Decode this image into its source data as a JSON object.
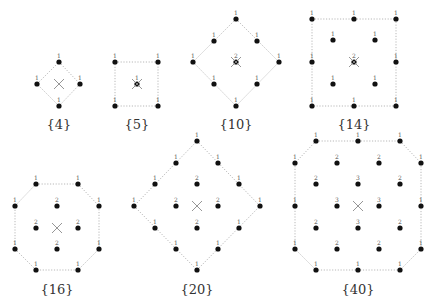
{
  "diagrams": [
    {
      "label": "{4}",
      "caption_pos": [
        59,
        129
      ],
      "center": [
        59,
        84
      ],
      "outline": [
        [
          59,
          62
        ],
        [
          80,
          84
        ],
        [
          59,
          106
        ],
        [
          37,
          84
        ]
      ],
      "points": [
        {
          "x": 59,
          "y": 62,
          "w": "1"
        },
        {
          "x": 37,
          "y": 84,
          "w": "1"
        },
        {
          "x": 80,
          "y": 84,
          "w": "1"
        },
        {
          "x": 59,
          "y": 106,
          "w": "1"
        }
      ]
    },
    {
      "label": "{5}",
      "caption_pos": [
        137,
        129
      ],
      "center": [
        137,
        84
      ],
      "outline": [
        [
          115,
          62
        ],
        [
          158,
          62
        ],
        [
          158,
          106
        ],
        [
          115,
          106
        ]
      ],
      "points": [
        {
          "x": 115,
          "y": 62,
          "w": "1"
        },
        {
          "x": 158,
          "y": 62,
          "w": "1"
        },
        {
          "x": 137,
          "y": 84,
          "w": "1"
        },
        {
          "x": 115,
          "y": 106,
          "w": "1"
        },
        {
          "x": 158,
          "y": 106,
          "w": "1"
        }
      ]
    },
    {
      "label": "{10}",
      "caption_pos": [
        236,
        129
      ],
      "center": [
        236,
        62
      ],
      "outline": [
        [
          236,
          19
        ],
        [
          279,
          62
        ],
        [
          236,
          106
        ],
        [
          193,
          62
        ]
      ],
      "points": [
        {
          "x": 236,
          "y": 19,
          "w": "1"
        },
        {
          "x": 214,
          "y": 41,
          "w": "1"
        },
        {
          "x": 257,
          "y": 41,
          "w": "1"
        },
        {
          "x": 193,
          "y": 62,
          "w": "1"
        },
        {
          "x": 236,
          "y": 62,
          "w": "2"
        },
        {
          "x": 279,
          "y": 62,
          "w": "1"
        },
        {
          "x": 214,
          "y": 84,
          "w": "1"
        },
        {
          "x": 257,
          "y": 84,
          "w": "1"
        },
        {
          "x": 236,
          "y": 106,
          "w": "1"
        }
      ]
    },
    {
      "label": "{14}",
      "caption_pos": [
        354,
        129
      ],
      "center": [
        354,
        62
      ],
      "outline": [
        [
          312,
          19
        ],
        [
          396,
          19
        ],
        [
          396,
          106
        ],
        [
          312,
          106
        ]
      ],
      "points": [
        {
          "x": 312,
          "y": 19,
          "w": "1"
        },
        {
          "x": 354,
          "y": 19,
          "w": "1"
        },
        {
          "x": 396,
          "y": 19,
          "w": "1"
        },
        {
          "x": 333,
          "y": 40,
          "w": "1"
        },
        {
          "x": 375,
          "y": 40,
          "w": "1"
        },
        {
          "x": 312,
          "y": 62,
          "w": "1"
        },
        {
          "x": 354,
          "y": 62,
          "w": "2"
        },
        {
          "x": 396,
          "y": 62,
          "w": "1"
        },
        {
          "x": 333,
          "y": 84,
          "w": "1"
        },
        {
          "x": 375,
          "y": 84,
          "w": "1"
        },
        {
          "x": 312,
          "y": 106,
          "w": "1"
        },
        {
          "x": 354,
          "y": 106,
          "w": "1"
        },
        {
          "x": 396,
          "y": 106,
          "w": "1"
        }
      ]
    },
    {
      "label": "{16}",
      "caption_pos": [
        57,
        294
      ],
      "center": [
        57,
        228
      ],
      "outline": [
        [
          36,
          184
        ],
        [
          78,
          184
        ],
        [
          99,
          206
        ],
        [
          99,
          249
        ],
        [
          78,
          270
        ],
        [
          36,
          270
        ],
        [
          15,
          249
        ],
        [
          15,
          206
        ]
      ],
      "points": [
        {
          "x": 36,
          "y": 184,
          "w": "1"
        },
        {
          "x": 78,
          "y": 184,
          "w": "1"
        },
        {
          "x": 15,
          "y": 206,
          "w": "1"
        },
        {
          "x": 57,
          "y": 206,
          "w": "2"
        },
        {
          "x": 99,
          "y": 206,
          "w": "1"
        },
        {
          "x": 36,
          "y": 228,
          "w": "2"
        },
        {
          "x": 78,
          "y": 228,
          "w": "2"
        },
        {
          "x": 15,
          "y": 249,
          "w": "1"
        },
        {
          "x": 57,
          "y": 249,
          "w": "2"
        },
        {
          "x": 99,
          "y": 249,
          "w": "1"
        },
        {
          "x": 36,
          "y": 270,
          "w": "1"
        },
        {
          "x": 78,
          "y": 270,
          "w": "1"
        }
      ]
    },
    {
      "label": "{20}",
      "caption_pos": [
        197,
        294
      ],
      "center": [
        197,
        206
      ],
      "outline": [
        [
          197,
          141
        ],
        [
          260,
          206
        ],
        [
          197,
          270
        ],
        [
          134,
          206
        ]
      ],
      "points": [
        {
          "x": 197,
          "y": 141,
          "w": "1"
        },
        {
          "x": 176,
          "y": 163,
          "w": "1"
        },
        {
          "x": 218,
          "y": 163,
          "w": "1"
        },
        {
          "x": 155,
          "y": 184,
          "w": "1"
        },
        {
          "x": 197,
          "y": 184,
          "w": "2"
        },
        {
          "x": 239,
          "y": 184,
          "w": "1"
        },
        {
          "x": 134,
          "y": 206,
          "w": "1"
        },
        {
          "x": 176,
          "y": 206,
          "w": "2"
        },
        {
          "x": 218,
          "y": 206,
          "w": "2"
        },
        {
          "x": 260,
          "y": 206,
          "w": "1"
        },
        {
          "x": 155,
          "y": 228,
          "w": "1"
        },
        {
          "x": 197,
          "y": 228,
          "w": "2"
        },
        {
          "x": 239,
          "y": 228,
          "w": "1"
        },
        {
          "x": 176,
          "y": 249,
          "w": "1"
        },
        {
          "x": 218,
          "y": 249,
          "w": "1"
        },
        {
          "x": 197,
          "y": 270,
          "w": "1"
        }
      ]
    },
    {
      "label": "{40}",
      "caption_pos": [
        358,
        294
      ],
      "center": [
        358,
        206
      ],
      "outline": [
        [
          316,
          141
        ],
        [
          400,
          141
        ],
        [
          421,
          163
        ],
        [
          421,
          249
        ],
        [
          400,
          270
        ],
        [
          316,
          270
        ],
        [
          295,
          249
        ],
        [
          295,
          163
        ]
      ],
      "points": [
        {
          "x": 316,
          "y": 141,
          "w": "1"
        },
        {
          "x": 358,
          "y": 141,
          "w": "1"
        },
        {
          "x": 400,
          "y": 141,
          "w": "1"
        },
        {
          "x": 295,
          "y": 163,
          "w": "1"
        },
        {
          "x": 337,
          "y": 163,
          "w": "2"
        },
        {
          "x": 379,
          "y": 163,
          "w": "2"
        },
        {
          "x": 421,
          "y": 163,
          "w": "1"
        },
        {
          "x": 316,
          "y": 184,
          "w": "2"
        },
        {
          "x": 358,
          "y": 184,
          "w": "3"
        },
        {
          "x": 400,
          "y": 184,
          "w": "2"
        },
        {
          "x": 295,
          "y": 206,
          "w": "1"
        },
        {
          "x": 337,
          "y": 206,
          "w": "3"
        },
        {
          "x": 379,
          "y": 206,
          "w": "3"
        },
        {
          "x": 421,
          "y": 206,
          "w": "1"
        },
        {
          "x": 316,
          "y": 228,
          "w": "2"
        },
        {
          "x": 358,
          "y": 228,
          "w": "3"
        },
        {
          "x": 400,
          "y": 228,
          "w": "2"
        },
        {
          "x": 295,
          "y": 249,
          "w": "1"
        },
        {
          "x": 337,
          "y": 249,
          "w": "2"
        },
        {
          "x": 379,
          "y": 249,
          "w": "2"
        },
        {
          "x": 421,
          "y": 249,
          "w": "1"
        },
        {
          "x": 316,
          "y": 270,
          "w": "1"
        },
        {
          "x": 358,
          "y": 270,
          "w": "1"
        },
        {
          "x": 400,
          "y": 270,
          "w": "1"
        }
      ]
    }
  ]
}
